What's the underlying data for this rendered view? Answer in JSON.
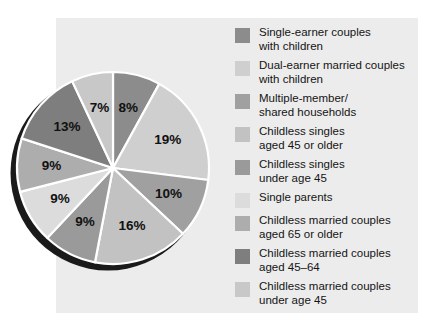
{
  "chart_data": {
    "type": "pie",
    "title": "",
    "subtitle": "",
    "xlabel": "",
    "ylabel": "",
    "legend_position": "right",
    "grid": false,
    "start_angle_deg": 0,
    "direction": "clockwise",
    "categories": [
      "Single-earner couples with children",
      "Dual-earner married couples with children",
      "Multiple-member/ shared households",
      "Childless singles aged 45 or older",
      "Childless singles under age 45",
      "Single parents",
      "Childless married couples aged 65 or older",
      "Childless married couples aged 45–64",
      "Childless married couples under age 45"
    ],
    "values": [
      8,
      19,
      10,
      16,
      9,
      9,
      9,
      13,
      7
    ],
    "value_labels": [
      "8%",
      "19%",
      "10%",
      "16%",
      "9%",
      "9%",
      "9%",
      "13%",
      "7%"
    ],
    "colors": [
      "#8c8c8c",
      "#cfcfcf",
      "#a0a0a0",
      "#c2c2c2",
      "#9a9a9a",
      "#dcdcdc",
      "#adadad",
      "#7e7e7e",
      "#c8c8c8"
    ]
  },
  "legend": {
    "items": [
      {
        "label": "Single-earner couples\nwith children",
        "color": "#8c8c8c"
      },
      {
        "label": "Dual-earner married couples\nwith children",
        "color": "#cfcfcf"
      },
      {
        "label": "Multiple-member/\nshared households",
        "color": "#a0a0a0"
      },
      {
        "label": "Childless singles\naged 45 or older",
        "color": "#c2c2c2"
      },
      {
        "label": "Childless singles\nunder age 45",
        "color": "#9a9a9a"
      },
      {
        "label": "Single parents",
        "color": "#dcdcdc"
      },
      {
        "label": "Childless married couples\naged 65 or older",
        "color": "#adadad"
      },
      {
        "label": "Childless married couples\naged 45–64",
        "color": "#7e7e7e"
      },
      {
        "label": "Childless married couples\nunder age 45",
        "color": "#c8c8c8"
      }
    ]
  },
  "style": {
    "panel_background": "#ececec",
    "page_background": "#ffffff",
    "separator_color": "#ffffff",
    "shadow_color": "#1a1a1a",
    "label_color": "#111111"
  }
}
